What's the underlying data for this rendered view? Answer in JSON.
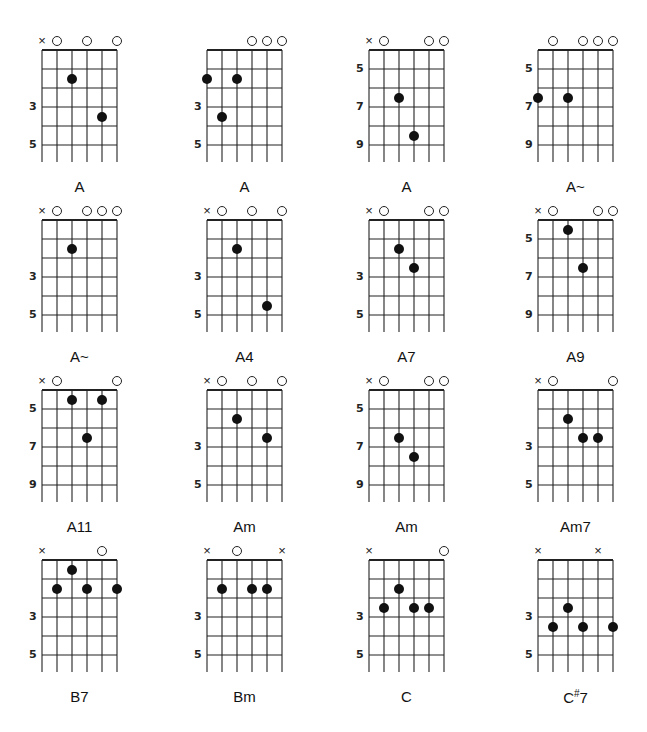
{
  "colors": {
    "ink": "#111111",
    "background": "#ffffff"
  },
  "chart_data": {
    "type": "table",
    "chords": [
      {
        "name": "A",
        "label": "A",
        "markers": [
          "x",
          "o",
          "",
          "o",
          "",
          "o"
        ],
        "fret_labels": [
          {
            "fret": 3,
            "text": "3"
          },
          {
            "fret": 5,
            "text": "5"
          }
        ],
        "dots": [
          {
            "string": 3,
            "fret": 2
          },
          {
            "string": 5,
            "fret": 4
          }
        ]
      },
      {
        "name": "A",
        "label": "A",
        "markers": [
          "",
          "",
          "",
          "o",
          "o",
          "o"
        ],
        "fret_labels": [
          {
            "fret": 3,
            "text": "3"
          },
          {
            "fret": 5,
            "text": "5"
          }
        ],
        "dots": [
          {
            "string": 1,
            "fret": 2
          },
          {
            "string": 3,
            "fret": 2
          },
          {
            "string": 2,
            "fret": 4
          }
        ]
      },
      {
        "name": "A",
        "label": "A",
        "markers": [
          "x",
          "o",
          "",
          "",
          "o",
          "o"
        ],
        "fret_labels": [
          {
            "fret": 1,
            "text": "5"
          },
          {
            "fret": 3,
            "text": "7"
          },
          {
            "fret": 5,
            "text": "9"
          }
        ],
        "dots": [
          {
            "string": 3,
            "fret": 3
          },
          {
            "string": 4,
            "fret": 5
          }
        ]
      },
      {
        "name": "A~",
        "label": "A~",
        "markers": [
          "",
          "o",
          "",
          "o",
          "o",
          "o"
        ],
        "fret_labels": [
          {
            "fret": 1,
            "text": "5"
          },
          {
            "fret": 3,
            "text": "7"
          },
          {
            "fret": 5,
            "text": "9"
          }
        ],
        "dots": [
          {
            "string": 1,
            "fret": 3
          },
          {
            "string": 3,
            "fret": 3
          }
        ]
      },
      {
        "name": "A~",
        "label": "A~",
        "markers": [
          "x",
          "o",
          "",
          "o",
          "o",
          "o"
        ],
        "fret_labels": [
          {
            "fret": 3,
            "text": "3"
          },
          {
            "fret": 5,
            "text": "5"
          }
        ],
        "dots": [
          {
            "string": 3,
            "fret": 2
          }
        ]
      },
      {
        "name": "A4",
        "label": "A4",
        "markers": [
          "x",
          "o",
          "",
          "o",
          "",
          "o"
        ],
        "fret_labels": [
          {
            "fret": 3,
            "text": "3"
          },
          {
            "fret": 5,
            "text": "5"
          }
        ],
        "dots": [
          {
            "string": 3,
            "fret": 2
          },
          {
            "string": 5,
            "fret": 5
          }
        ]
      },
      {
        "name": "A7",
        "label": "A7",
        "markers": [
          "x",
          "o",
          "",
          "",
          "o",
          "o"
        ],
        "fret_labels": [
          {
            "fret": 3,
            "text": "3"
          },
          {
            "fret": 5,
            "text": "5"
          }
        ],
        "dots": [
          {
            "string": 3,
            "fret": 2
          },
          {
            "string": 4,
            "fret": 3
          }
        ]
      },
      {
        "name": "A9",
        "label": "A9",
        "markers": [
          "x",
          "o",
          "",
          "",
          "o",
          "o"
        ],
        "fret_labels": [
          {
            "fret": 1,
            "text": "5"
          },
          {
            "fret": 3,
            "text": "7"
          },
          {
            "fret": 5,
            "text": "9"
          }
        ],
        "dots": [
          {
            "string": 3,
            "fret": 1
          },
          {
            "string": 4,
            "fret": 3
          }
        ]
      },
      {
        "name": "A11",
        "label": "A11",
        "markers": [
          "x",
          "o",
          "",
          "",
          "",
          "o"
        ],
        "fret_labels": [
          {
            "fret": 1,
            "text": "5"
          },
          {
            "fret": 3,
            "text": "7"
          },
          {
            "fret": 5,
            "text": "9"
          }
        ],
        "dots": [
          {
            "string": 3,
            "fret": 1
          },
          {
            "string": 5,
            "fret": 1
          },
          {
            "string": 4,
            "fret": 3
          }
        ]
      },
      {
        "name": "Am",
        "label": "Am",
        "markers": [
          "x",
          "o",
          "",
          "o",
          "",
          "o"
        ],
        "fret_labels": [
          {
            "fret": 3,
            "text": "3"
          },
          {
            "fret": 5,
            "text": "5"
          }
        ],
        "dots": [
          {
            "string": 3,
            "fret": 2
          },
          {
            "string": 5,
            "fret": 3
          }
        ]
      },
      {
        "name": "Am",
        "label": "Am",
        "markers": [
          "x",
          "o",
          "",
          "",
          "o",
          "o"
        ],
        "fret_labels": [
          {
            "fret": 1,
            "text": "5"
          },
          {
            "fret": 3,
            "text": "7"
          },
          {
            "fret": 5,
            "text": "9"
          }
        ],
        "dots": [
          {
            "string": 3,
            "fret": 3
          },
          {
            "string": 4,
            "fret": 4
          }
        ]
      },
      {
        "name": "Am7",
        "label": "Am7",
        "markers": [
          "x",
          "o",
          "",
          "",
          "",
          "o"
        ],
        "fret_labels": [
          {
            "fret": 3,
            "text": "3"
          },
          {
            "fret": 5,
            "text": "5"
          }
        ],
        "dots": [
          {
            "string": 3,
            "fret": 2
          },
          {
            "string": 4,
            "fret": 3
          },
          {
            "string": 5,
            "fret": 3
          }
        ]
      },
      {
        "name": "B7",
        "label": "B7",
        "markers": [
          "x",
          "",
          "",
          "",
          "o",
          ""
        ],
        "fret_labels": [
          {
            "fret": 3,
            "text": "3"
          },
          {
            "fret": 5,
            "text": "5"
          }
        ],
        "dots": [
          {
            "string": 3,
            "fret": 1
          },
          {
            "string": 2,
            "fret": 2
          },
          {
            "string": 4,
            "fret": 2
          },
          {
            "string": 6,
            "fret": 2
          }
        ]
      },
      {
        "name": "Bm",
        "label": "Bm",
        "markers": [
          "x",
          "",
          "o",
          "",
          "",
          "x"
        ],
        "fret_labels": [
          {
            "fret": 3,
            "text": "3"
          },
          {
            "fret": 5,
            "text": "5"
          }
        ],
        "dots": [
          {
            "string": 2,
            "fret": 2
          },
          {
            "string": 4,
            "fret": 2
          },
          {
            "string": 5,
            "fret": 2
          }
        ]
      },
      {
        "name": "C",
        "label": "C",
        "markers": [
          "x",
          "",
          "",
          "",
          "",
          "o"
        ],
        "fret_labels": [
          {
            "fret": 3,
            "text": "3"
          },
          {
            "fret": 5,
            "text": "5"
          }
        ],
        "dots": [
          {
            "string": 3,
            "fret": 2
          },
          {
            "string": 2,
            "fret": 3
          },
          {
            "string": 4,
            "fret": 3
          },
          {
            "string": 5,
            "fret": 3
          }
        ]
      },
      {
        "name": "C#7",
        "label": "C#7",
        "markers": [
          "x",
          "",
          "",
          "",
          "x",
          ""
        ],
        "fret_labels": [
          {
            "fret": 3,
            "text": "3"
          },
          {
            "fret": 5,
            "text": "5"
          }
        ],
        "dots": [
          {
            "string": 3,
            "fret": 3
          },
          {
            "string": 2,
            "fret": 4
          },
          {
            "string": 4,
            "fret": 4
          },
          {
            "string": 6,
            "fret": 4
          }
        ]
      }
    ]
  },
  "labels": {
    "c0": "A",
    "c1": "A",
    "c2": "A",
    "c3": "A~",
    "c4": "A~",
    "c5": "A4",
    "c6": "A7",
    "c7": "A9",
    "c8": "A11",
    "c9": "Am",
    "c10": "Am",
    "c11": "Am7",
    "c12": "B7",
    "c13": "Bm",
    "c14": "C",
    "c15_base": "C",
    "c15_sup": "#",
    "c15_tail": "7"
  }
}
